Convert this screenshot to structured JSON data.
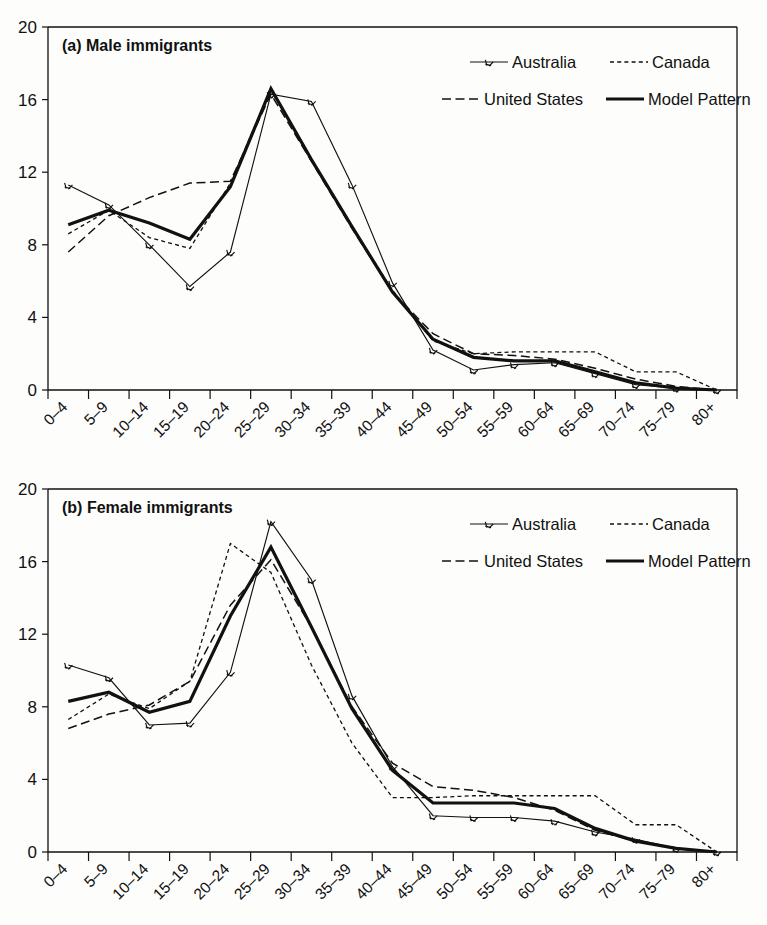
{
  "figure": {
    "background_color": "#fdfdfc",
    "line_color": "#111111",
    "panels": [
      "male",
      "female"
    ]
  },
  "legend": {
    "entries": [
      {
        "label": "Australia",
        "style": "solid-with-star-markers",
        "key": "australia"
      },
      {
        "label": "Canada",
        "style": "dotted",
        "key": "canada"
      },
      {
        "label": "United States",
        "style": "dashed",
        "key": "united_states"
      },
      {
        "label": "Model Pattern",
        "style": "thick-solid",
        "key": "model_pattern"
      }
    ]
  },
  "chart_data": [
    {
      "type": "line",
      "id": "male",
      "title": "(a) Male immigrants",
      "xlabel": "",
      "ylabel": "",
      "ylim": [
        0,
        20
      ],
      "yticks": [
        0,
        4,
        8,
        12,
        16,
        20
      ],
      "grid": false,
      "legend_position": "top-right",
      "categories": [
        "0–4",
        "5–9",
        "10–14",
        "15–19",
        "20–24",
        "25–29",
        "30–34",
        "35–39",
        "40–44",
        "45–49",
        "50–54",
        "55–59",
        "60–64",
        "65–69",
        "70–74",
        "75–79",
        "80+"
      ],
      "series": [
        {
          "name": "Australia",
          "key": "australia",
          "values": [
            11.3,
            10.2,
            8.0,
            5.7,
            7.6,
            16.3,
            15.9,
            11.3,
            5.9,
            2.2,
            1.1,
            1.4,
            1.5,
            0.9,
            0.3,
            0.1,
            0.0
          ]
        },
        {
          "name": "Canada",
          "key": "canada",
          "values": [
            8.6,
            9.9,
            8.4,
            7.8,
            11.4,
            16.6,
            12.6,
            9.0,
            5.5,
            2.7,
            2.0,
            2.1,
            2.1,
            2.1,
            1.0,
            1.0,
            0.0
          ]
        },
        {
          "name": "United States",
          "key": "united_states",
          "values": [
            7.6,
            9.6,
            10.6,
            11.4,
            11.5,
            16.3,
            12.6,
            8.9,
            5.4,
            3.1,
            2.0,
            1.9,
            1.7,
            1.2,
            0.6,
            0.2,
            0.0
          ]
        },
        {
          "name": "Model Pattern",
          "key": "model_pattern",
          "values": [
            9.1,
            9.9,
            9.2,
            8.3,
            11.2,
            16.6,
            12.7,
            9.0,
            5.4,
            2.8,
            1.8,
            1.6,
            1.6,
            1.0,
            0.4,
            0.1,
            0.0
          ]
        }
      ]
    },
    {
      "type": "line",
      "id": "female",
      "title": "(b) Female immigrants",
      "xlabel": "",
      "ylabel": "",
      "ylim": [
        0,
        20
      ],
      "yticks": [
        0,
        4,
        8,
        12,
        16,
        20
      ],
      "grid": false,
      "legend_position": "top-right",
      "categories": [
        "0–4",
        "5–9",
        "10–14",
        "15–19",
        "20–24",
        "25–29",
        "30–34",
        "35–39",
        "40–44",
        "45–49",
        "50–54",
        "55–59",
        "60–64",
        "65–69",
        "70–74",
        "75–79",
        "80+"
      ],
      "series": [
        {
          "name": "Australia",
          "key": "australia",
          "values": [
            10.3,
            9.6,
            7.0,
            7.1,
            9.9,
            18.2,
            15.0,
            8.6,
            4.7,
            2.0,
            1.9,
            1.9,
            1.7,
            1.1,
            0.7,
            0.2,
            0.0
          ]
        },
        {
          "name": "Canada",
          "key": "canada",
          "values": [
            7.3,
            8.7,
            7.9,
            9.4,
            17.0,
            15.4,
            10.3,
            6.0,
            3.0,
            3.0,
            3.1,
            3.1,
            3.1,
            3.1,
            1.5,
            1.5,
            0.0
          ]
        },
        {
          "name": "United States",
          "key": "united_states",
          "values": [
            6.8,
            7.6,
            8.1,
            9.4,
            13.6,
            16.1,
            12.4,
            8.0,
            4.9,
            3.6,
            3.4,
            3.0,
            2.3,
            1.2,
            0.6,
            0.2,
            0.0
          ]
        },
        {
          "name": "Model Pattern",
          "key": "model_pattern",
          "values": [
            8.3,
            8.8,
            7.7,
            8.3,
            13.0,
            16.8,
            12.4,
            7.9,
            4.5,
            2.7,
            2.7,
            2.7,
            2.4,
            1.3,
            0.6,
            0.2,
            0.0
          ]
        }
      ]
    }
  ]
}
